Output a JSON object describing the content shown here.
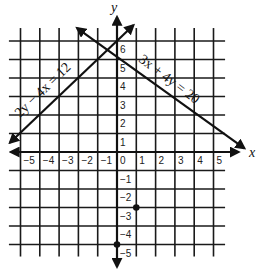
{
  "diagram": {
    "type": "coordinate-plane",
    "x_axis": {
      "label": "x",
      "range": [
        -5,
        5
      ],
      "ticks": [
        -5,
        -4,
        -3,
        -2,
        -1,
        0,
        1,
        2,
        3,
        4,
        5
      ]
    },
    "y_axis": {
      "label": "y",
      "range": [
        -5,
        6
      ],
      "ticks": [
        6,
        5,
        4,
        3,
        2,
        1,
        -1,
        -2,
        -3,
        -4,
        -5
      ]
    },
    "origin_label": "0",
    "lines": [
      {
        "id": "line-a",
        "equation": "2y − 4x = 12"
      },
      {
        "id": "line-b",
        "equation": "3x + 4y = 20"
      }
    ],
    "points": [
      {
        "x": 0,
        "y": -5
      },
      {
        "x": 1,
        "y": -3
      }
    ]
  }
}
